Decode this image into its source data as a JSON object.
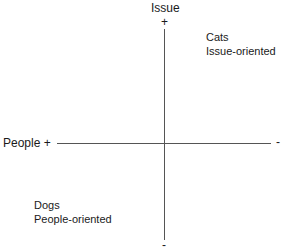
{
  "diagram": {
    "type": "quadrant",
    "vertical_axis": {
      "label": "Issue",
      "top_sign": "+",
      "bottom_sign": "-"
    },
    "horizontal_axis": {
      "label": "People",
      "left_sign": "+",
      "right_sign": "-"
    },
    "quadrants": {
      "top_right": {
        "title": "Cats",
        "subtitle": "Issue-oriented"
      },
      "bottom_left": {
        "title": "Dogs",
        "subtitle": "People-oriented"
      }
    },
    "colors": {
      "line": "#555555",
      "text": "#1a1a1a",
      "background": "#ffffff"
    }
  }
}
